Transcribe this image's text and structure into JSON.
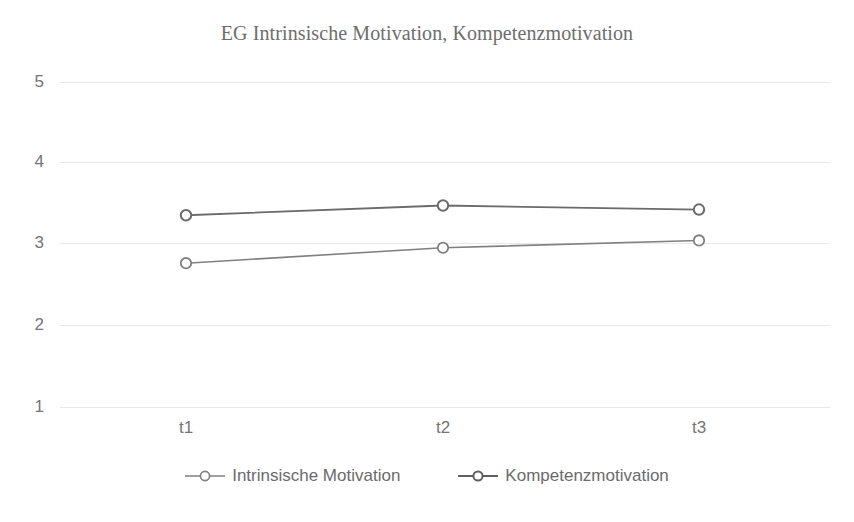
{
  "chart_data": {
    "type": "line",
    "title": "EG Intrinsische Motivation, Kompetenzmotivation",
    "xlabel": "",
    "ylabel": "",
    "categories": [
      "t1",
      "t2",
      "t3"
    ],
    "ylim": [
      1,
      5
    ],
    "yticks": [
      1,
      2,
      3,
      4,
      5
    ],
    "ytick_labels": [
      "1",
      "2",
      "3",
      "4",
      "5"
    ],
    "grid": true,
    "legend_position": "bottom",
    "marker": "open-circle",
    "series": [
      {
        "name": "Intrinsische Motivation",
        "values": [
          2.77,
          2.96,
          3.05
        ],
        "color": "#808080"
      },
      {
        "name": "Kompetenzmotivation",
        "values": [
          3.36,
          3.48,
          3.43
        ],
        "color": "#6b6b6b"
      }
    ]
  },
  "legend": {
    "items": [
      {
        "label": "Intrinsische Motivation"
      },
      {
        "label": "Kompetenzmotivation"
      }
    ]
  },
  "colors": {
    "background": "#ffffff",
    "gridline": "#e9e9e9",
    "axis_text": "#757575",
    "title_text": "#6d6d6d",
    "series_1": "#808080",
    "series_2": "#6b6b6b"
  }
}
